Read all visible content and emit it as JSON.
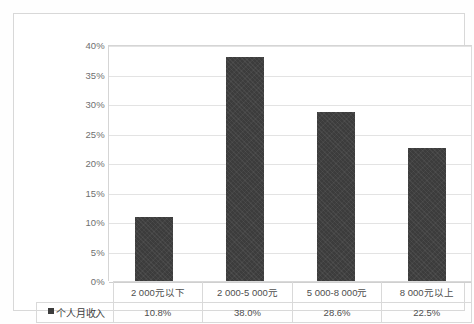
{
  "chart_data": {
    "type": "bar",
    "title": "",
    "xlabel": "",
    "ylabel": "",
    "ylim": [
      0,
      40
    ],
    "ytick_labels": [
      "40%",
      "35%",
      "30%",
      "25%",
      "20%",
      "15%",
      "10%",
      "5%",
      "0%"
    ],
    "ytick_values": [
      40,
      35,
      30,
      25,
      20,
      15,
      10,
      5,
      0
    ],
    "grid": true,
    "legend_position": "table-row-header",
    "categories": [
      "2 000元以下",
      "2 000-5 000元",
      "5 000-8 000元",
      "8 000元以上"
    ],
    "series": [
      {
        "name": "个人月收入",
        "values": [
          10.8,
          38.0,
          28.6,
          22.5
        ],
        "value_labels": [
          "10.8%",
          "38.0%",
          "28.6%",
          "22.5%"
        ],
        "color": "#3c3c3c"
      }
    ]
  },
  "table": {
    "legend_label": "个人月收入",
    "legend_marker": "black-square-marker",
    "category_row": [
      "2 000元以下",
      "2 000-5 000元",
      "5 000-8 000元",
      "8 000元以上"
    ],
    "value_row": [
      "10.8%",
      "38.0%",
      "28.6%",
      "22.5%"
    ]
  },
  "colors": {
    "bar": "#3c3c3c",
    "gridline": "#e3e3e3",
    "axis": "#d5d5d5",
    "frame": "#d8d8d8",
    "text": "#4e4e4e",
    "background": "#ffffff"
  }
}
